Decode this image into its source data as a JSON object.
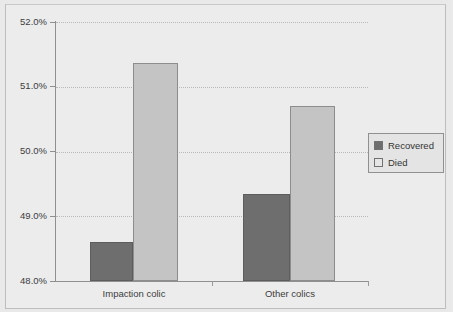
{
  "chart_data": {
    "type": "bar",
    "title": "",
    "subtitle": "",
    "xlabel": "",
    "ylabel": "",
    "categories": [
      "Impaction colic",
      "Other colics"
    ],
    "series": [
      {
        "name": "Recovered",
        "values": [
          48.6,
          49.35
        ],
        "color": "#6e6e6e"
      },
      {
        "name": "Died",
        "values": [
          51.37,
          50.7
        ],
        "color": "#c4c4c4"
      }
    ],
    "ylim": [
      48.0,
      52.0
    ],
    "ytick_values": [
      52.0,
      51.0,
      50.0,
      49.0,
      48.0
    ],
    "ytick_labels": [
      "52.0%",
      "51.0%",
      "50.0%",
      "49.0%",
      "48.0%"
    ],
    "grid": true,
    "grid_style": "dotted",
    "legend": {
      "position": "right",
      "entries": [
        {
          "label": "Recovered",
          "swatch": "dark-gray"
        },
        {
          "label": "Died",
          "swatch": "light-gray"
        }
      ]
    },
    "background_color": "#ececec",
    "axis_color": "#8f8f8f"
  },
  "axis": {
    "y_ticks": [
      {
        "label": "52.0%",
        "value": 52.0
      },
      {
        "label": "51.0%",
        "value": 51.0
      },
      {
        "label": "50.0%",
        "value": 50.0
      },
      {
        "label": "49.0%",
        "value": 49.0
      },
      {
        "label": "48.0%",
        "value": 48.0
      }
    ],
    "x_categories": [
      {
        "label": "Impaction colic"
      },
      {
        "label": "Other colics"
      }
    ]
  },
  "bars": [
    {
      "name": "impaction-colic-recovered",
      "series": "Recovered",
      "category": "Impaction colic",
      "value": 48.6
    },
    {
      "name": "impaction-colic-died",
      "series": "Died",
      "category": "Impaction colic",
      "value": 51.37
    },
    {
      "name": "other-colics-recovered",
      "series": "Recovered",
      "category": "Other colics",
      "value": 49.35
    },
    {
      "name": "other-colics-died",
      "series": "Died",
      "category": "Other colics",
      "value": 50.7
    }
  ],
  "legend": {
    "recovered_label": "Recovered",
    "died_label": "Died"
  }
}
